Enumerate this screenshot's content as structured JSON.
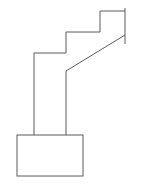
{
  "diagram": {
    "width": 146,
    "height": 186,
    "background": "#ffffff",
    "stroke_color": "#5a5a5a",
    "stroke_width": 1,
    "staircase_path": "M34 135 L34 53 L66 53 L66 32 L100 32 L100 11 L125 11",
    "right_edge": {
      "x1": 125,
      "y1": 8,
      "x2": 125,
      "y2": 44
    },
    "diagonal": "M125 35 L66 71 L66 135",
    "base_box": {
      "x": 17,
      "y": 135,
      "width": 66,
      "height": 41
    }
  }
}
